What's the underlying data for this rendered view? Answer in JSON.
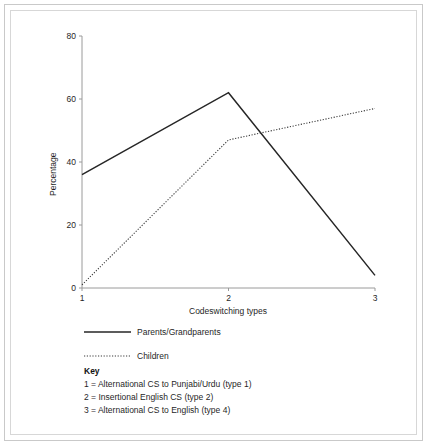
{
  "chart_data": {
    "type": "line",
    "title": "",
    "xlabel": "Codeswitching types",
    "ylabel": "Percentage",
    "xlim": [
      1,
      3
    ],
    "ylim": [
      0,
      80
    ],
    "ytick_labels": [
      "80",
      "60",
      "40",
      "20",
      "0"
    ],
    "ytick_values": [
      80,
      60,
      40,
      20,
      0
    ],
    "xtick_labels": [
      "1",
      "2",
      "3"
    ],
    "xtick_values": [
      1,
      2,
      3
    ],
    "grid": false,
    "legend_position": "below-axes",
    "series": [
      {
        "name": "Parents/Grandparents",
        "style": "solid",
        "color": "#262626",
        "x": [
          1,
          2,
          3
        ],
        "values": [
          36,
          62,
          4
        ]
      },
      {
        "name": "Children",
        "style": "dotted",
        "color": "#3a3a3a",
        "x": [
          1,
          2,
          2.1,
          3
        ],
        "values": [
          1,
          47,
          48,
          57
        ]
      }
    ]
  },
  "legend": {
    "items": [
      {
        "label": "Parents/Grandparents",
        "style": "solid"
      },
      {
        "label": "Children",
        "style": "dotted"
      }
    ]
  },
  "key": {
    "heading": "Key",
    "lines": [
      "1 = Alternational CS to Punjabi/Urdu (type 1)",
      "2 = Insertional English CS (type 2)",
      "3 = Alternational CS to English (type 4)"
    ]
  },
  "colors": {
    "axis": "#9a9a9a",
    "series_solid": "#262626",
    "series_dotted": "#3a3a3a",
    "frame_outer": "#c9c9c9",
    "frame_inner": "#d7d7d7",
    "text": "#1f1f1f"
  }
}
